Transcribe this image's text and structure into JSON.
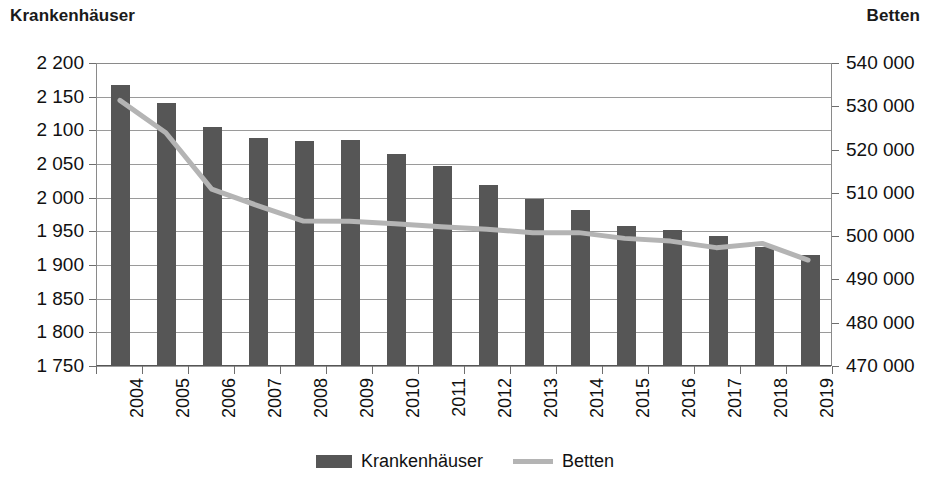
{
  "axis_titles": {
    "left": "Krankenhäuser",
    "right": "Betten"
  },
  "legend": {
    "items": [
      {
        "label": "Krankenhäuser",
        "marker": "bar-swatch",
        "color": "#565656"
      },
      {
        "label": "Betten",
        "marker": "line-swatch",
        "color": "#b4b4b4"
      }
    ]
  },
  "colors": {
    "bar": "#565656",
    "line": "#b4b4b4",
    "gridline": "#9a9a9a",
    "axis": "#6e6e6e",
    "text": "#111111",
    "background": "#ffffff"
  },
  "chart_data": {
    "type": "bar",
    "title": "",
    "subtitle": "",
    "xlabel": "",
    "ylabel": "Krankenhäuser",
    "y2label": "Betten",
    "grid": true,
    "legend_position": "bottom",
    "categories": [
      "2004",
      "2005",
      "2006",
      "2007",
      "2008",
      "2009",
      "2010",
      "2011",
      "2012",
      "2013",
      "2014",
      "2015",
      "2016",
      "2017",
      "2018",
      "2019"
    ],
    "ylim": [
      1750,
      2200
    ],
    "ytick_step": 50,
    "yticks": [
      2200,
      2150,
      2100,
      2050,
      2000,
      1950,
      1900,
      1850,
      1800,
      1750
    ],
    "ytick_labels": [
      "2 200",
      "2 150",
      "2 100",
      "2 050",
      "2 000",
      "1 950",
      "1 900",
      "1 850",
      "1 800",
      "1 750"
    ],
    "y2lim": [
      470000,
      540000
    ],
    "y2tick_step": 10000,
    "y2ticks": [
      540000,
      530000,
      520000,
      510000,
      500000,
      490000,
      480000,
      470000
    ],
    "y2tick_labels": [
      "540 000",
      "530 000",
      "520 000",
      "510 000",
      "500 000",
      "490 000",
      "480 000",
      "470 000"
    ],
    "series": [
      {
        "name": "Krankenhäuser",
        "type": "bar",
        "axis": "left",
        "color": "#565656",
        "values": [
          2166,
          2139,
          2104,
          2087,
          2083,
          2084,
          2064,
          2045,
          2017,
          1996,
          1980,
          1956,
          1951,
          1942,
          1925,
          1914
        ]
      },
      {
        "name": "Betten",
        "type": "line",
        "axis": "right",
        "color": "#b4b4b4",
        "values": [
          531333,
          523824,
          510767,
          506954,
          503360,
          503341,
          502749,
          502029,
          501475,
          500671,
          500680,
          499351,
          498718,
          497200,
          498192,
          494326
        ]
      }
    ]
  }
}
